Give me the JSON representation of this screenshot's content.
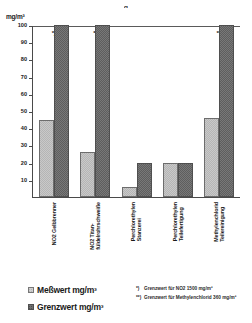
{
  "top_partial_text": "g",
  "axis": {
    "y_unit_label": "mg/m³",
    "y_ticks": [
      "100",
      "90",
      "80",
      "70",
      "60",
      "50",
      "40",
      "30",
      "20",
      "10"
    ]
  },
  "legend": {
    "items": [
      {
        "label": "Meßwert mg/m³",
        "swatch": "light-hatched-swatch"
      },
      {
        "label": "Grenzwert mg/m³",
        "swatch": "dark-hatched-swatch"
      }
    ]
  },
  "footnotes": [
    {
      "mark": "*)",
      "text": "Grenzwert für NO2 1500 mg/m³"
    },
    {
      "mark": "**)",
      "text": "Grenzwert für Methylenchlorid  360 mg/m³"
    }
  ],
  "categories_display": [
    "NO2  Gelbbrenner",
    "NO2  Titan-\nfüldelrohrschweiße",
    "Perchlorethylen\nStanzerei",
    "Perchlorethylen\nTeilefertigung",
    "Methylenchlorid\nTeilereinigung"
  ],
  "bar_notes": [
    "*)",
    "*)",
    "",
    "",
    "**)"
  ],
  "chart_data": {
    "type": "bar",
    "title": "",
    "xlabel": "",
    "ylabel": "mg/m³",
    "ylim": [
      0,
      100
    ],
    "ytick_step": 10,
    "grid": false,
    "legend_position": "bottom-left",
    "categories": [
      "NO2 Gelbbrenner",
      "NO2 Titan-füldelrohrschweiße",
      "Perchlorethylen Stanzerei",
      "Perchlorethylen Teilefertigung",
      "Methylenchlorid Teilereinigung"
    ],
    "series": [
      {
        "name": "Meßwert mg/m³",
        "values": [
          45,
          26,
          6,
          20,
          46
        ],
        "color": "#c9c9c9"
      },
      {
        "name": "Grenzwert mg/m³",
        "values": [
          100,
          100,
          20,
          20,
          100
        ],
        "color": "#787878"
      }
    ],
    "annotations": [
      {
        "category": "NO2 Gelbbrenner",
        "mark": "*)",
        "meaning": "Grenzwert für NO2 1500 mg/m³ (axis clipped at 100)"
      },
      {
        "category": "NO2 Titan-füldelrohrschweiße",
        "mark": "*)",
        "meaning": "Grenzwert für NO2 1500 mg/m³ (axis clipped at 100)"
      },
      {
        "category": "Methylenchlorid Teilereinigung",
        "mark": "**)",
        "meaning": "Grenzwert für Methylenchlorid 360 mg/m³ (axis clipped at 100)"
      }
    ]
  }
}
